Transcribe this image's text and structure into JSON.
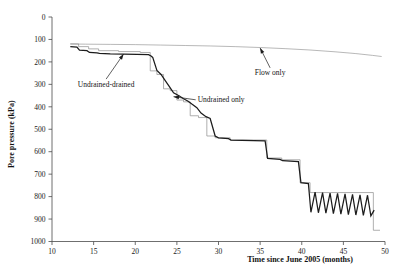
{
  "chart_data": {
    "type": "line",
    "title": "",
    "xlabel": "Time since June 2005 (months)",
    "ylabel": "Pore pressure (kPa)",
    "xlim": [
      10,
      50
    ],
    "ylim": [
      0,
      1000
    ],
    "xticks": [
      10,
      15,
      20,
      25,
      30,
      35,
      40,
      45,
      50
    ],
    "yticks": [
      0,
      100,
      200,
      300,
      400,
      500,
      600,
      700,
      800,
      900,
      1000
    ],
    "grid": false,
    "legend": "inline-annotations",
    "annotations": [
      {
        "text": "Undrained-drained",
        "x": 16.5,
        "y": 690,
        "leader_to_x": 18.6,
        "leader_to_y": 835
      },
      {
        "text": "Undrained only",
        "x": 27.5,
        "y": 620,
        "leader_to_x": 24.6,
        "leader_to_y": 645
      },
      {
        "text": "Flow only",
        "x": 36.2,
        "y": 740,
        "leader_to_x": 35.0,
        "leader_to_y": 862
      }
    ],
    "series": [
      {
        "name": "Flow only",
        "style": "thin-smooth-gray",
        "x": [
          12.2,
          14.0,
          17.0,
          20.0,
          23.0,
          26.0,
          29.0,
          32.0,
          35.0,
          38.0,
          41.0,
          44.0,
          46.5,
          48.5,
          49.6
        ],
        "values": [
          880,
          879,
          878,
          877,
          875,
          873,
          871,
          868,
          864,
          859,
          853,
          845,
          837,
          829,
          824
        ]
      },
      {
        "name": "Undrained only",
        "style": "thin-step-gray",
        "x": [
          12.2,
          13.2,
          13.2,
          14.4,
          14.4,
          15.6,
          15.6,
          18.0,
          18.0,
          20.6,
          20.6,
          21.8,
          21.8,
          22.6,
          22.6,
          23.4,
          23.4,
          24.2,
          24.2,
          25.0,
          25.0,
          25.8,
          25.8,
          26.6,
          26.6,
          27.6,
          27.6,
          28.6,
          28.6,
          29.6,
          29.6,
          31.4,
          31.4,
          35.8,
          35.8,
          37.6,
          37.6,
          39.8,
          39.8,
          41.0,
          41.0,
          48.6,
          48.6,
          49.4
        ],
        "values": [
          880,
          880,
          868,
          868,
          858,
          858,
          850,
          850,
          846,
          846,
          842,
          842,
          760,
          760,
          744,
          744,
          680,
          680,
          672,
          672,
          630,
          630,
          622,
          622,
          560,
          560,
          552,
          552,
          470,
          470,
          462,
          462,
          452,
          452,
          372,
          372,
          364,
          364,
          262,
          262,
          218,
          218,
          50,
          50
        ]
      },
      {
        "name": "Undrained-drained",
        "style": "thick-black",
        "x": [
          12.2,
          13.0,
          13.3,
          14.2,
          14.5,
          15.4,
          15.7,
          17.0,
          20.2,
          21.6,
          21.9,
          22.1,
          22.6,
          23.1,
          23.5,
          24.1,
          24.6,
          25.3,
          25.8,
          26.3,
          26.8,
          27.4,
          27.9,
          28.5,
          29.0,
          29.6,
          30.0,
          31.2,
          31.5,
          35.6,
          35.9,
          37.4,
          37.7,
          39.6,
          39.9,
          40.8,
          41.1,
          41.6,
          42.0,
          42.5,
          42.9,
          43.4,
          43.8,
          44.3,
          44.7,
          45.2,
          45.6,
          46.1,
          46.5,
          47.0,
          47.4,
          47.9,
          48.3,
          48.7
        ],
        "values": [
          868,
          866,
          852,
          850,
          842,
          840,
          838,
          836,
          834,
          832,
          826,
          820,
          762,
          744,
          722,
          690,
          662,
          648,
          636,
          626,
          612,
          596,
          572,
          556,
          548,
          470,
          462,
          458,
          452,
          448,
          370,
          366,
          360,
          356,
          262,
          258,
          130,
          220,
          128,
          218,
          126,
          216,
          124,
          214,
          122,
          212,
          120,
          210,
          118,
          208,
          116,
          206,
          114,
          140
        ]
      }
    ]
  },
  "axes": {
    "y_label": "Pore pressure (kPa)",
    "x_label": "Time since June 2005 (months)",
    "y_tick_labels": [
      "1000",
      "900",
      "800",
      "700",
      "600",
      "500",
      "400",
      "300",
      "200",
      "100",
      "0"
    ],
    "x_tick_labels": [
      "10",
      "15",
      "20",
      "25",
      "30",
      "35",
      "40",
      "45",
      "50"
    ]
  },
  "labels": {
    "undrained_drained": "Undrained-drained",
    "undrained_only": "Undrained only",
    "flow_only": "Flow only"
  },
  "colors": {
    "thick_line": "#1c1c1c",
    "thin_line": "#8c8c8c",
    "axis": "#4a4a4a",
    "background": "#ffffff"
  }
}
